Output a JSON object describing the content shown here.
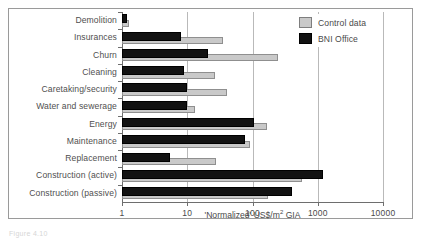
{
  "figure": {
    "caption": "Figure 4.10"
  },
  "legend": {
    "position": "top-right",
    "entries": [
      {
        "label": "Control data",
        "color": "#c9c9c9",
        "key": "control"
      },
      {
        "label": "BNI Office",
        "color": "#121212",
        "key": "bni"
      }
    ]
  },
  "chart_data": {
    "type": "bar",
    "orientation": "horizontal",
    "scale": "log",
    "title": "",
    "subtitle": "",
    "xlabel": "'Normalized' US$/m2 GIA",
    "xlabel_rich": "'Normalized' US$/m² GIA",
    "ylabel": "",
    "xlim": [
      1,
      10000
    ],
    "xticks": [
      1,
      10,
      100,
      1000,
      10000
    ],
    "xtick_labels": [
      "1",
      "10",
      "100",
      "1000",
      "10000"
    ],
    "grid": true,
    "grid_axis": "x",
    "legend_position": "top-right",
    "categories": [
      "Demolition",
      "Insurances",
      "Churn",
      "Cleaning",
      "Caretaking/security",
      "Water and sewerage",
      "Energy",
      "Maintenance",
      "Replacement",
      "Construction (active)",
      "Construction (passive)"
    ],
    "series": [
      {
        "name": "Control data",
        "color": "#c9c9c9",
        "values": [
          1.3,
          35,
          250,
          27,
          40,
          13,
          165,
          92,
          28,
          580,
          175
        ]
      },
      {
        "name": "BNI Office",
        "color": "#121212",
        "values": [
          1.2,
          8,
          21,
          9,
          10,
          10,
          105,
          78,
          5.5,
          1200,
          400
        ]
      }
    ]
  },
  "colors": {
    "control": "#c9c9c9",
    "bni": "#121212",
    "axis": "#6e6e6e",
    "grid": "#b9b9b9",
    "frame": "#9a9a9a",
    "text": "#4a4a4a"
  }
}
